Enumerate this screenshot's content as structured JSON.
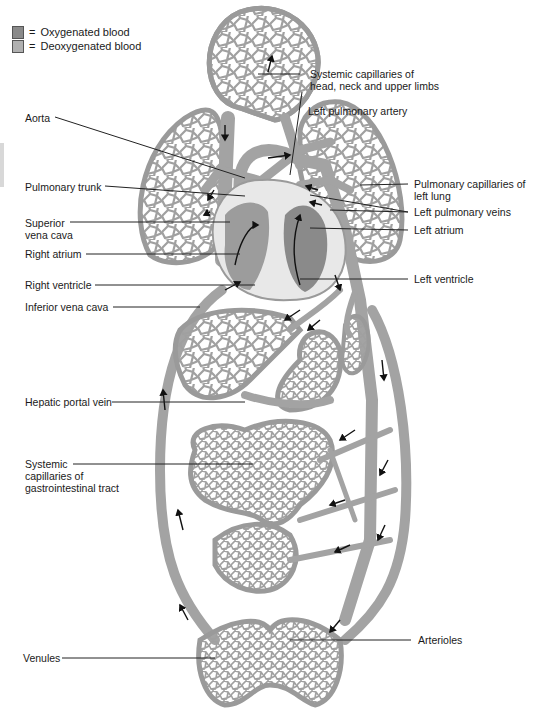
{
  "legend": {
    "items": [
      {
        "symbol": "=",
        "label": "Oxygenated blood",
        "swatch_color": "#8a8a8a"
      },
      {
        "symbol": "=",
        "label": "Deoxygenated blood",
        "swatch_color": "#b0b0b0"
      }
    ]
  },
  "labels": {
    "head_capillaries": [
      "Systemic capillaries of",
      "head, neck and upper limbs"
    ],
    "left_pulmonary_artery": "Left pulmonary artery",
    "aorta": "Aorta",
    "pulmonary_trunk": "Pulmonary trunk",
    "superior_vena_cava": [
      "Superior",
      "vena cava"
    ],
    "right_atrium": "Right atrium",
    "right_ventricle": "Right ventricle",
    "inferior_vena_cava": "Inferior vena cava",
    "pulmonary_capillaries_left_lung": [
      "Pulmonary capillaries of",
      "left lung"
    ],
    "left_pulmonary_veins": "Left pulmonary veins",
    "left_atrium": "Left atrium",
    "left_ventricle": "Left ventricle",
    "hepatic_portal_vein": "Hepatic portal vein",
    "gi_capillaries": [
      "Systemic",
      "capillaries of",
      "gastrointestinal tract"
    ],
    "arterioles": "Arterioles",
    "venules": "Venules"
  },
  "colors": {
    "vessel": "#a3a3a3",
    "oxygenated": "#8a8a8a",
    "deoxygenated": "#b0b0b0",
    "text": "#1a1a1a"
  }
}
